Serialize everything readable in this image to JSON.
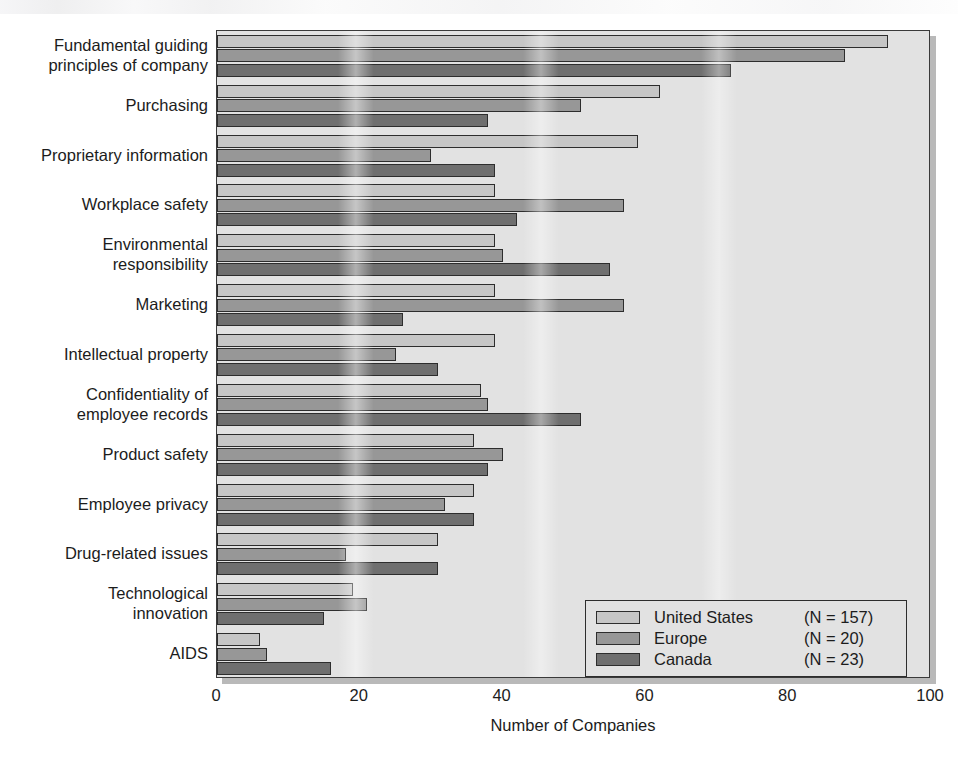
{
  "chart_data": {
    "type": "bar",
    "orientation": "horizontal",
    "title": "",
    "xlabel": "Number of Companies",
    "ylabel": "",
    "xlim": [
      0,
      100
    ],
    "xticks": [
      0,
      20,
      40,
      60,
      80,
      100
    ],
    "xtick_labels": [
      "0",
      "20",
      "40",
      "60",
      "80",
      "100"
    ],
    "grid": false,
    "legend_position": "bottom-right",
    "categories": [
      "Fundamental guiding\nprinciples of company",
      "Purchasing",
      "Proprietary information",
      "Workplace safety",
      "Environmental\nresponsibility",
      "Marketing",
      "Intellectual property",
      "Confidentiality of\nemployee records",
      "Product safety",
      "Employee privacy",
      "Drug-related issues",
      "Technological\ninnovation",
      "AIDS"
    ],
    "series": [
      {
        "name": "United States",
        "n_label": "(N = 157)",
        "n": 157,
        "color": "#c6c6c6",
        "values": [
          94,
          62,
          59,
          39,
          39,
          39,
          39,
          37,
          36,
          36,
          31,
          19,
          6
        ]
      },
      {
        "name": "Europe",
        "n_label": "(N = 20)",
        "n": 20,
        "color": "#979797",
        "values": [
          88,
          51,
          30,
          57,
          40,
          57,
          25,
          38,
          40,
          32,
          18,
          21,
          7
        ]
      },
      {
        "name": "Canada",
        "n_label": "(N = 23)",
        "n": 23,
        "color": "#6f6f6f",
        "values": [
          72,
          38,
          39,
          42,
          55,
          26,
          31,
          51,
          38,
          36,
          31,
          15,
          16
        ]
      }
    ]
  },
  "axis": {
    "x_title": "Number of Companies",
    "tick_0": "0",
    "tick_20": "20",
    "tick_40": "40",
    "tick_60": "60",
    "tick_80": "80",
    "tick_100": "100"
  },
  "legend": {
    "rows": [
      {
        "name": "United States",
        "n": "(N = 157)"
      },
      {
        "name": "Europe",
        "n": "(N = 20)"
      },
      {
        "name": "Canada",
        "n": "(N = 23)"
      }
    ]
  }
}
